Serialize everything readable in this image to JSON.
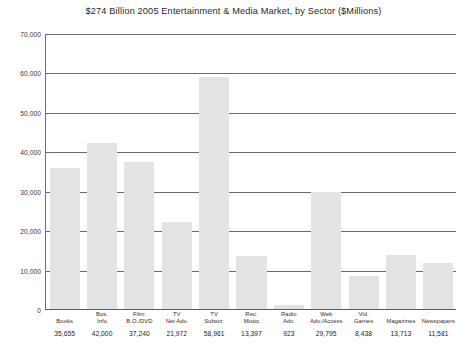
{
  "chart_data": {
    "type": "bar",
    "title": "$274 Billion 2005 Entertainment & Media Market, by Sector ($Millions)",
    "xlabel": "",
    "ylabel": "",
    "ylim": [
      0,
      70000
    ],
    "ytick_step": 10000,
    "grid": true,
    "legend": "none",
    "categories": [
      "Books",
      "Bus. Info",
      "Film: B.O./DVD",
      "TV Net Adv.",
      "TV Subscr.",
      "Rec. Music",
      "Radio Adv.",
      "Web Adv./Access",
      "Vid. Games",
      "Magazines",
      "Newspapers"
    ],
    "category_lines": [
      [
        "Books",
        ""
      ],
      [
        "Bus.",
        "Info"
      ],
      [
        "Film:",
        "B.O./DVD"
      ],
      [
        "TV",
        "Net Adv."
      ],
      [
        "TV",
        "Subscr."
      ],
      [
        "Rec.",
        "Music"
      ],
      [
        "Radio",
        "Adv."
      ],
      [
        "Web",
        "Adv./Access"
      ],
      [
        "Vid.",
        "Games"
      ],
      [
        "Magazines",
        ""
      ],
      [
        "Newspapers",
        ""
      ]
    ],
    "values": [
      35655,
      42000,
      37240,
      21972,
      58961,
      13397,
      923,
      29795,
      8438,
      13713,
      11581
    ],
    "value_labels": [
      "35,655",
      "42,000",
      "37,240",
      "21,972",
      "58,961",
      "13,397",
      "923",
      "29,795",
      "8,438",
      "13,713",
      "11,581"
    ],
    "ytick_labels": [
      "70,000",
      "60,000",
      "50,000",
      "40,000",
      "30,000",
      "20,000",
      "10,000",
      "0"
    ],
    "ytick_values": [
      70000,
      60000,
      50000,
      40000,
      30000,
      20000,
      10000,
      0
    ],
    "colors": {
      "bar_fill": "#e3e3e3",
      "gridline": "#6b6b6b",
      "axis": "#5a5a5a",
      "text": "#222222",
      "background": "#ffffff"
    }
  }
}
